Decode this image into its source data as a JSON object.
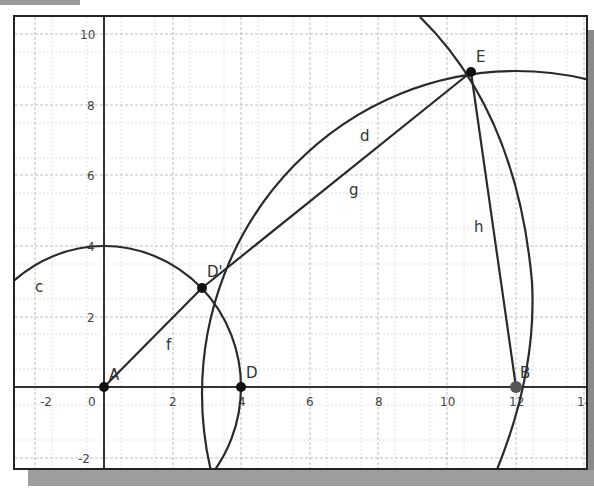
{
  "figure": {
    "type": "geometry-construction",
    "axes": {
      "x_ticks": [
        "-2",
        "0",
        "2",
        "4",
        "6",
        "8",
        "10",
        "12",
        "14"
      ],
      "y_ticks": [
        "10",
        "8",
        "6",
        "4",
        "2",
        "-2"
      ],
      "xlim": [
        -2.5,
        14.1
      ],
      "ylim": [
        -2.4,
        10.3
      ]
    },
    "points": [
      {
        "name": "A",
        "x": 0,
        "y": 0
      },
      {
        "name": "B",
        "x": 12,
        "y": 0
      },
      {
        "name": "D",
        "x": 4,
        "y": 0
      },
      {
        "name": "D'",
        "x": 2.9,
        "y": 2.8
      },
      {
        "name": "E",
        "x": 10.7,
        "y": 8.9
      }
    ],
    "objects": [
      {
        "name": "c",
        "kind": "circle",
        "label": "c"
      },
      {
        "name": "d",
        "kind": "circle",
        "label": "d"
      },
      {
        "name": "f",
        "kind": "segment",
        "label": "f"
      },
      {
        "name": "g",
        "kind": "segment",
        "label": "g"
      },
      {
        "name": "h",
        "kind": "segment",
        "label": "h"
      }
    ]
  }
}
